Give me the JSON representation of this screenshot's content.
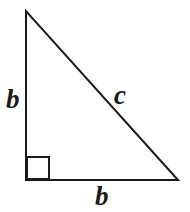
{
  "figure": {
    "name": "right-triangle-diagram",
    "background_color": "#ffffff",
    "stroke_color": "#1a1a1a",
    "stroke_width": 2,
    "width": 190,
    "height": 212
  },
  "geometry": {
    "vertices": {
      "apex": {
        "x": 26,
        "y": 11
      },
      "right_angle_corner": {
        "x": 26,
        "y": 180
      },
      "bottom_right": {
        "x": 178,
        "y": 180
      }
    },
    "right_angle_marker": {
      "x": 27,
      "y": 157,
      "size": 22
    }
  },
  "labels": {
    "leg_vertical": "b",
    "hypotenuse": "c",
    "leg_horizontal": "b"
  }
}
